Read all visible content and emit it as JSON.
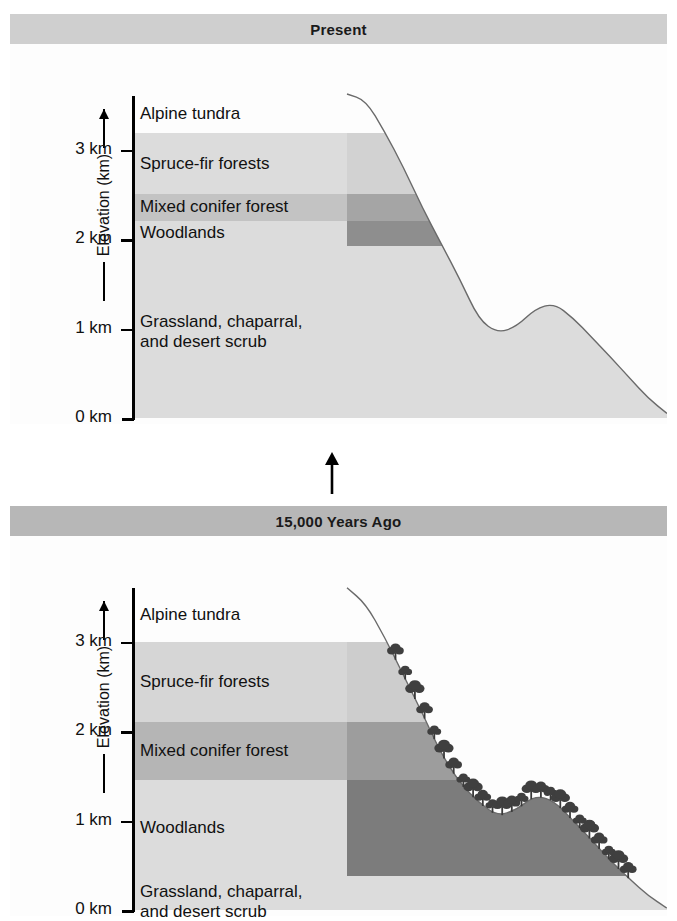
{
  "figure": {
    "axis_title": "Elevation (km)",
    "flow_arrow": "up-arrow"
  },
  "panels": [
    {
      "id": "present",
      "title": "Present",
      "title_bar_color": "#cfcfcf",
      "tick_labels": [
        "3 km",
        "2 km",
        "1 km",
        "0 km"
      ],
      "tick_values": [
        3,
        2,
        1,
        0
      ],
      "zones": [
        {
          "name": "Alpine tundra",
          "top_km": 3.6,
          "bottom_km": 3.18,
          "color_left": "#fdfdfd",
          "color_right": "#fdfdfd"
        },
        {
          "name": "Spruce-fir forests",
          "top_km": 3.18,
          "bottom_km": 2.5,
          "color_left": "#dcdcdc",
          "color_right": "#d2d2d2"
        },
        {
          "name": "Mixed conifer forest",
          "top_km": 2.5,
          "bottom_km": 2.2,
          "color_left": "#c3c3c3",
          "color_right": "#a5a5a5"
        },
        {
          "name": "Woodlands",
          "top_km": 2.2,
          "bottom_km": 1.92,
          "color_left": "#dcdcdc",
          "color_right": "#8e8e8e"
        },
        {
          "name": "Grassland, chaparral,\nand desert scrub",
          "top_km": 1.92,
          "bottom_km": 0.0,
          "color_left": "#dcdcdc",
          "color_right": "#dcdcdc"
        }
      ],
      "treeline_km": 1.92,
      "tree_type": "conifer",
      "ridge_km": [
        3.62,
        3.55,
        3.2,
        2.8,
        2.35,
        1.95,
        1.55,
        1.1,
        0.95,
        1.02,
        1.22,
        1.28,
        1.12,
        0.9,
        0.68,
        0.45,
        0.22,
        0.05
      ]
    },
    {
      "id": "past",
      "title": "15,000 Years Ago",
      "title_bar_color": "#b7b7b7",
      "tick_labels": [
        "3 km",
        "2 km",
        "1 km",
        "0 km"
      ],
      "tick_values": [
        3,
        2,
        1,
        0
      ],
      "zones": [
        {
          "name": "Alpine tundra",
          "top_km": 3.6,
          "bottom_km": 3.0,
          "color_left": "#fdfdfd",
          "color_right": "#fdfdfd"
        },
        {
          "name": "Spruce-fir forests",
          "top_km": 3.0,
          "bottom_km": 2.1,
          "color_left": "#d6d6d6",
          "color_right": "#cdcdcd"
        },
        {
          "name": "Mixed conifer forest",
          "top_km": 2.1,
          "bottom_km": 1.45,
          "color_left": "#b5b5b5",
          "color_right": "#9d9d9d"
        },
        {
          "name": "Woodlands",
          "top_km": 1.45,
          "bottom_km": 0.38,
          "color_left": "#dcdcdc",
          "color_right": "#7c7c7c"
        },
        {
          "name": "Grassland, chaparral,\nand desert scrub",
          "top_km": 0.38,
          "bottom_km": 0.0,
          "color_left": "#dcdcdc",
          "color_right": "#dcdcdc"
        }
      ],
      "treeline_km": 2.95,
      "tree_type": "broadleaf",
      "ridge_km": [
        3.6,
        3.42,
        3.05,
        2.62,
        2.2,
        1.75,
        1.42,
        1.2,
        1.05,
        1.12,
        1.28,
        1.22,
        1.0,
        0.78,
        0.55,
        0.35,
        0.16,
        0.02
      ]
    }
  ],
  "chart_data": {
    "type": "area",
    "ylabel": "Elevation (km)",
    "ylim": [
      0,
      3.6
    ],
    "ytick_values": [
      0,
      1,
      2,
      3
    ],
    "ytick_labels": [
      "0 km",
      "1 km",
      "2 km",
      "3 km"
    ],
    "grid": false,
    "legend": "none",
    "series": [
      {
        "name": "Present",
        "zone_boundaries_km": {
          "alpine_tundra": [
            3.18,
            3.6
          ],
          "spruce_fir_forests": [
            2.5,
            3.18
          ],
          "mixed_conifer_forest": [
            2.2,
            2.5
          ],
          "woodlands": [
            1.92,
            2.2
          ],
          "grassland_chaparral_desert_scrub": [
            0.0,
            1.92
          ]
        }
      },
      {
        "name": "15,000 Years Ago",
        "zone_boundaries_km": {
          "alpine_tundra": [
            3.0,
            3.6
          ],
          "spruce_fir_forests": [
            2.1,
            3.0
          ],
          "mixed_conifer_forest": [
            1.45,
            2.1
          ],
          "woodlands": [
            0.38,
            1.45
          ],
          "grassland_chaparral_desert_scrub": [
            0.0,
            0.38
          ]
        }
      }
    ]
  }
}
